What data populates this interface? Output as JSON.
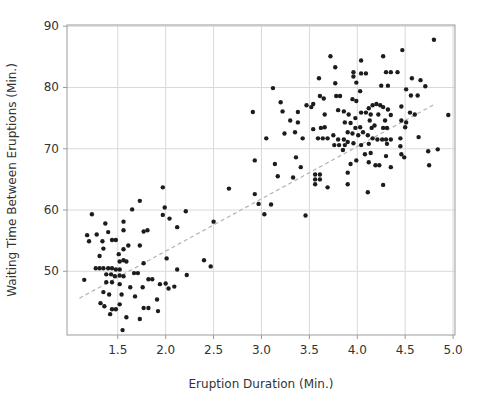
{
  "chart_data": {
    "type": "scatter",
    "title": "",
    "xlabel": "Eruption Duration (Min.)",
    "ylabel": "Waiting Time Between Eruptions (Min.)",
    "xlim": [
      0.97,
      5.02
    ],
    "ylim": [
      39.6,
      90.2
    ],
    "x_tick_values": [
      1.5,
      2.0,
      2.5,
      3.0,
      3.5,
      4.0,
      4.5,
      5.0
    ],
    "x_tick_labels": [
      "1.5",
      "2.0",
      "2.5",
      "3.0",
      "3.5",
      "4.0",
      "4.5",
      "5.0"
    ],
    "y_tick_values": [
      50,
      60,
      70,
      80,
      90
    ],
    "y_tick_labels": [
      "50",
      "60",
      "70",
      "80",
      "90"
    ],
    "grid": true,
    "legend": "none",
    "marker_color": "#1c1c1c",
    "grid_color": "#d9d9d9",
    "axis_color": "#9b9b9b",
    "text_color": "#333333",
    "trendline": {
      "style": "dashed",
      "color": "#b3b3b3",
      "x1": 1.1,
      "y1": 45.6,
      "x2": 4.8,
      "y2": 77.2
    },
    "points": [
      [
        1.73,
        61.5
      ],
      [
        1.65,
        60.1
      ],
      [
        1.99,
        60.4
      ],
      [
        1.23,
        59.3
      ],
      [
        1.97,
        59.2
      ],
      [
        2.21,
        59.8
      ],
      [
        2.04,
        58.6
      ],
      [
        1.56,
        58.1
      ],
      [
        2.5,
        58.1
      ],
      [
        1.37,
        57.8
      ],
      [
        2.12,
        57.2
      ],
      [
        1.77,
        56.5
      ],
      [
        1.81,
        56.7
      ],
      [
        1.56,
        56.7
      ],
      [
        1.4,
        56.4
      ],
      [
        1.28,
        56.0
      ],
      [
        1.18,
        55.9
      ],
      [
        1.44,
        55.1
      ],
      [
        1.48,
        55.1
      ],
      [
        1.2,
        54.9
      ],
      [
        1.34,
        54.9
      ],
      [
        1.61,
        54.2
      ],
      [
        1.73,
        54.2
      ],
      [
        1.35,
        53.7
      ],
      [
        1.56,
        53.6
      ],
      [
        1.51,
        52.8
      ],
      [
        1.31,
        52.5
      ],
      [
        2.01,
        52.1
      ],
      [
        1.52,
        51.6
      ],
      [
        1.56,
        51.8
      ],
      [
        1.59,
        51.6
      ],
      [
        1.77,
        51.3
      ],
      [
        2.4,
        51.8
      ],
      [
        2.47,
        50.8
      ],
      [
        1.27,
        50.5
      ],
      [
        1.31,
        50.5
      ],
      [
        1.35,
        50.5
      ],
      [
        1.4,
        50.5
      ],
      [
        1.44,
        50.5
      ],
      [
        1.48,
        50.3
      ],
      [
        1.52,
        50.3
      ],
      [
        2.12,
        50.3
      ],
      [
        1.67,
        49.7
      ],
      [
        1.71,
        49.7
      ],
      [
        1.38,
        49.5
      ],
      [
        1.43,
        49.5
      ],
      [
        1.52,
        49.3
      ],
      [
        1.47,
        49.2
      ],
      [
        1.56,
        49.2
      ],
      [
        2.22,
        49.4
      ],
      [
        1.15,
        48.6
      ],
      [
        1.82,
        48.7
      ],
      [
        1.86,
        48.7
      ],
      [
        1.38,
        48.2
      ],
      [
        1.44,
        48.2
      ],
      [
        2.0,
        48.0
      ],
      [
        1.94,
        47.9
      ],
      [
        1.52,
        47.9
      ],
      [
        2.09,
        47.5
      ],
      [
        1.63,
        47.4
      ],
      [
        1.76,
        47.4
      ],
      [
        2.03,
        47.2
      ],
      [
        1.35,
        46.6
      ],
      [
        1.41,
        46.2
      ],
      [
        1.54,
        46.2
      ],
      [
        1.68,
        45.9
      ],
      [
        1.91,
        45.4
      ],
      [
        1.32,
        44.8
      ],
      [
        1.52,
        44.6
      ],
      [
        1.36,
        44.3
      ],
      [
        1.77,
        44.0
      ],
      [
        1.82,
        44.0
      ],
      [
        1.44,
        43.8
      ],
      [
        1.48,
        43.8
      ],
      [
        1.92,
        43.5
      ],
      [
        1.42,
        43.0
      ],
      [
        1.59,
        42.5
      ],
      [
        1.73,
        42.2
      ],
      [
        1.55,
        40.4
      ],
      [
        1.97,
        63.7
      ],
      [
        2.66,
        63.5
      ],
      [
        4.8,
        87.8
      ],
      [
        4.47,
        86.1
      ],
      [
        4.27,
        85.1
      ],
      [
        3.72,
        85.1
      ],
      [
        4.04,
        84.4
      ],
      [
        3.77,
        83.3
      ],
      [
        3.96,
        82.5
      ],
      [
        4.3,
        82.5
      ],
      [
        4.35,
        82.5
      ],
      [
        4.42,
        82.5
      ],
      [
        4.04,
        82.3
      ],
      [
        4.09,
        82.3
      ],
      [
        3.96,
        81.8
      ],
      [
        3.6,
        81.5
      ],
      [
        4.57,
        81.5
      ],
      [
        4.66,
        81.2
      ],
      [
        3.99,
        80.8
      ],
      [
        3.77,
        80.7
      ],
      [
        4.25,
        80.3
      ],
      [
        4.32,
        80.3
      ],
      [
        4.71,
        80.2
      ],
      [
        3.12,
        79.9
      ],
      [
        4.51,
        79.7
      ],
      [
        4.03,
        79.4
      ],
      [
        4.56,
        78.7
      ],
      [
        4.63,
        78.7
      ],
      [
        3.61,
        78.6
      ],
      [
        3.78,
        78.6
      ],
      [
        3.82,
        78.6
      ],
      [
        3.65,
        78.2
      ],
      [
        3.95,
        78.1
      ],
      [
        3.99,
        77.8
      ],
      [
        3.2,
        77.6
      ],
      [
        3.54,
        77.3
      ],
      [
        4.2,
        77.3
      ],
      [
        3.47,
        77.1
      ],
      [
        4.16,
        77.1
      ],
      [
        4.24,
        77.1
      ],
      [
        4.46,
        76.9
      ],
      [
        3.52,
        76.8
      ],
      [
        4.27,
        76.8
      ],
      [
        4.12,
        76.6
      ],
      [
        4.32,
        76.4
      ],
      [
        3.8,
        76.3
      ],
      [
        3.22,
        76.1
      ],
      [
        3.86,
        76.1
      ],
      [
        2.91,
        76.0
      ],
      [
        3.38,
        76.0
      ],
      [
        4.04,
        75.9
      ],
      [
        4.09,
        75.9
      ],
      [
        4.55,
        75.9
      ],
      [
        3.66,
        75.6
      ],
      [
        3.91,
        75.6
      ],
      [
        4.14,
        75.6
      ],
      [
        4.22,
        75.6
      ],
      [
        4.6,
        75.6
      ],
      [
        4.35,
        75.5
      ],
      [
        4.95,
        75.5
      ],
      [
        3.98,
        75.0
      ],
      [
        3.3,
        74.6
      ],
      [
        4.13,
        74.6
      ],
      [
        4.29,
        74.6
      ],
      [
        4.46,
        74.6
      ],
      [
        3.38,
        74.3
      ],
      [
        3.87,
        74.3
      ],
      [
        4.51,
        74.3
      ],
      [
        3.93,
        74.2
      ],
      [
        4.18,
        73.8
      ],
      [
        3.66,
        73.5
      ],
      [
        4.03,
        73.5
      ],
      [
        4.5,
        73.5
      ],
      [
        3.62,
        73.4
      ],
      [
        3.98,
        73.4
      ],
      [
        4.15,
        73.4
      ],
      [
        4.27,
        73.4
      ],
      [
        4.31,
        73.4
      ],
      [
        3.54,
        73.2
      ],
      [
        3.24,
        72.5
      ],
      [
        3.35,
        72.7
      ],
      [
        3.75,
        72.2
      ],
      [
        3.9,
        72.7
      ],
      [
        3.95,
        72.5
      ],
      [
        4.01,
        72.2
      ],
      [
        4.06,
        72.7
      ],
      [
        4.11,
        72.2
      ],
      [
        4.64,
        71.9
      ],
      [
        3.05,
        71.7
      ],
      [
        3.43,
        71.7
      ],
      [
        3.59,
        71.7
      ],
      [
        3.64,
        71.7
      ],
      [
        3.69,
        71.7
      ],
      [
        4.16,
        71.7
      ],
      [
        4.45,
        71.7
      ],
      [
        3.8,
        71.5
      ],
      [
        3.86,
        71.5
      ],
      [
        4.21,
        71.5
      ],
      [
        4.26,
        71.5
      ],
      [
        4.3,
        71.5
      ],
      [
        4.35,
        71.5
      ],
      [
        3.9,
        71.1
      ],
      [
        3.96,
        70.9
      ],
      [
        4.04,
        70.6
      ],
      [
        3.76,
        70.6
      ],
      [
        3.81,
        70.6
      ],
      [
        3.87,
        70.6
      ],
      [
        4.12,
        70.8
      ],
      [
        4.31,
        70.8
      ],
      [
        4.45,
        70.4
      ],
      [
        4.84,
        69.9
      ],
      [
        3.85,
        69.8
      ],
      [
        4.74,
        69.6
      ],
      [
        4.08,
        69.1
      ],
      [
        4.46,
        69.1
      ],
      [
        4.14,
        69.3
      ],
      [
        3.36,
        68.6
      ],
      [
        4.49,
        68.6
      ],
      [
        4.3,
        68.8
      ],
      [
        2.93,
        68.1
      ],
      [
        3.99,
        68.1
      ],
      [
        4.12,
        67.8
      ],
      [
        3.14,
        67.5
      ],
      [
        3.93,
        67.5
      ],
      [
        4.19,
        67.3
      ],
      [
        4.23,
        67.3
      ],
      [
        4.75,
        67.3
      ],
      [
        3.41,
        67.0
      ],
      [
        4.35,
        67.0
      ],
      [
        3.9,
        66.1
      ],
      [
        3.56,
        65.8
      ],
      [
        3.61,
        65.8
      ],
      [
        3.17,
        65.5
      ],
      [
        3.33,
        65.3
      ],
      [
        3.56,
        65.0
      ],
      [
        3.61,
        65.0
      ],
      [
        3.56,
        64.2
      ],
      [
        3.9,
        64.2
      ],
      [
        4.27,
        64.1
      ],
      [
        3.69,
        63.7
      ],
      [
        4.11,
        62.9
      ],
      [
        2.93,
        62.6
      ],
      [
        2.97,
        61.0
      ],
      [
        3.1,
        60.9
      ],
      [
        3.03,
        59.3
      ],
      [
        3.46,
        59.1
      ]
    ]
  }
}
